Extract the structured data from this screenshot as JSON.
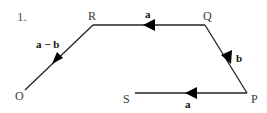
{
  "question_number": "1.",
  "points": {
    "O": {
      "label": "O",
      "x": 25,
      "y": 90
    },
    "R": {
      "label": "R",
      "x": 93,
      "y": 25
    },
    "Q": {
      "label": "Q",
      "x": 205,
      "y": 25
    },
    "P": {
      "label": "P",
      "x": 247,
      "y": 93
    },
    "S": {
      "label": "S",
      "x": 135,
      "y": 93
    }
  },
  "segments": [
    {
      "from": "R",
      "to": "O",
      "vector_label": "a − b",
      "arrow_direction": "toward O"
    },
    {
      "from": "Q",
      "to": "R",
      "vector_label": "a",
      "arrow_direction": "toward R"
    },
    {
      "from": "Q",
      "to": "P",
      "vector_label": "b",
      "arrow_direction": "toward P"
    },
    {
      "from": "P",
      "to": "S",
      "vector_label": "a",
      "arrow_direction": "toward S"
    }
  ],
  "labels": {
    "num": "1.",
    "R": "R",
    "Q": "Q",
    "P": "P",
    "S": "S",
    "O": "O",
    "vec_RO": "a − b",
    "vec_QR": "a",
    "vec_QP": "b",
    "vec_PS": "a"
  },
  "colors": {
    "line": "#222222",
    "arrow": "#000000",
    "text": "#3a3a3a"
  }
}
